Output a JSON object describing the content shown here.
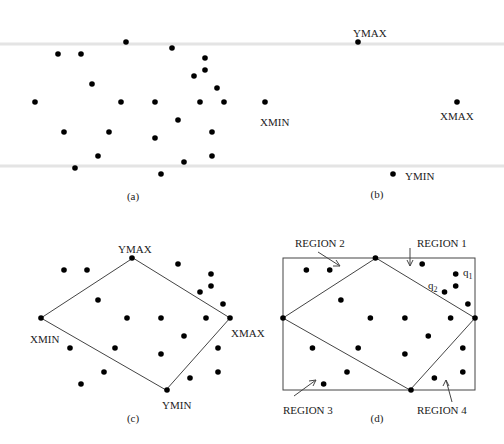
{
  "figure": {
    "panels": [
      {
        "id": "a",
        "caption": "(a)"
      },
      {
        "id": "b",
        "caption": "(b)"
      },
      {
        "id": "c",
        "caption": "(c)"
      },
      {
        "id": "d",
        "caption": "(d)"
      }
    ],
    "labels": {
      "ymax": "YMAX",
      "ymin": "YMIN",
      "xmin": "XMIN",
      "xmax": "XMAX",
      "region1": "REGION 1",
      "region2": "REGION 2",
      "region3": "REGION 3",
      "region4": "REGION 4",
      "q1": "q",
      "q1_sub": "1",
      "q2": "q",
      "q2_sub": "2"
    },
    "point_set": [
      [
        126,
        42
      ],
      [
        172,
        48
      ],
      [
        58,
        54
      ],
      [
        81,
        54
      ],
      [
        205,
        58
      ],
      [
        205,
        70
      ],
      [
        194,
        76
      ],
      [
        92,
        84
      ],
      [
        217,
        88
      ],
      [
        35,
        102
      ],
      [
        121,
        102
      ],
      [
        155,
        102
      ],
      [
        200,
        102
      ],
      [
        224,
        102
      ],
      [
        178,
        120
      ],
      [
        64,
        132
      ],
      [
        109,
        132
      ],
      [
        155,
        138
      ],
      [
        212,
        132
      ],
      [
        98,
        156
      ],
      [
        212,
        156
      ],
      [
        184,
        162
      ],
      [
        75,
        168
      ],
      [
        161,
        174
      ]
    ],
    "extreme_points": {
      "ymax": [
        126,
        42
      ],
      "ymin": [
        161,
        174
      ],
      "xmin": [
        35,
        102
      ],
      "xmax": [
        224,
        102
      ]
    }
  }
}
